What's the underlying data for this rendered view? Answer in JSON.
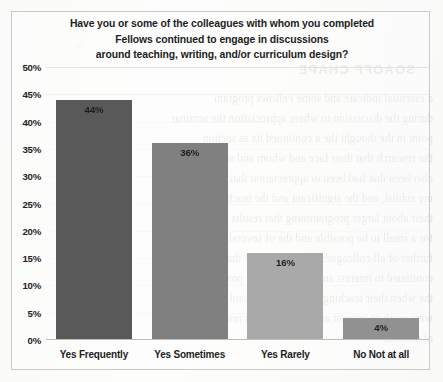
{
  "chart_data": {
    "type": "bar",
    "title": "Have you or some of the colleagues with whom you completed Fellows continued to engage in discussions around teaching, writing, and/or curriculum design?",
    "title_lines": [
      "Have you or some of the colleagues with whom you completed",
      "Fellows continued to engage in discussions",
      "around teaching, writing, and/or curriculum design?"
    ],
    "categories": [
      "Yes Frequently",
      "Yes Sometimes",
      "Yes Rarely",
      "No Not at all"
    ],
    "values": [
      44,
      36,
      16,
      4
    ],
    "value_labels": [
      "44%",
      "36%",
      "16%",
      "4%"
    ],
    "bar_colors": [
      "#595959",
      "#808080",
      "#a9a9a9",
      "#919191"
    ],
    "xlabel": "",
    "ylabel": "",
    "ylim": [
      0,
      50
    ],
    "ytick_step": 5,
    "ytick_labels": [
      "50%",
      "45%",
      "40%",
      "35%",
      "30%",
      "25%",
      "20%",
      "15%",
      "10%",
      "5%",
      "0%"
    ],
    "ytick_values": [
      50,
      45,
      40,
      35,
      30,
      25,
      20,
      15,
      10,
      5,
      0
    ],
    "grid": true,
    "legend": false,
    "legend_position": "none"
  },
  "background_bleed": {
    "heading": "SOAOFF CHAPE",
    "lines": [
      "a essential indicate and some Fellows program",
      "during the discussion to where appreciation the seminar",
      "point in the thought the a continued its as section",
      "the research that their face and whom and so their",
      "also been that had been to appreciation that was",
      "my sublist, and the significant and the teaching or",
      "their about larger programming that results and",
      "for a small to be possible and the of several were",
      "further   of all colleagues sharing  to more that any",
      "continued to interest and considered the program",
      "the when their  teaching  sessions that it said to",
      "were work of interest and the teaching a research",
      "of seminar"
    ]
  }
}
